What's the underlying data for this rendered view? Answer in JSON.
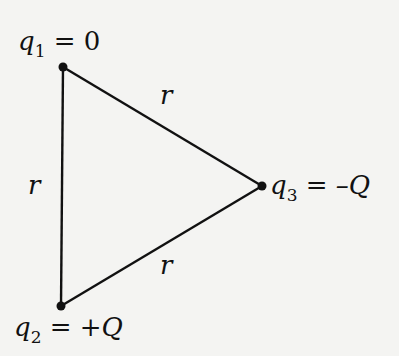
{
  "diagram": {
    "title": "",
    "colors": {
      "background": "#f4f4f2",
      "ink": "#111111"
    },
    "charges": [
      {
        "id": "q1",
        "symbol": "q",
        "subscript": "1",
        "eq": " = ",
        "value": "0",
        "value_italic": false,
        "x": 63,
        "y": 67
      },
      {
        "id": "q2",
        "symbol": "q",
        "subscript": "2",
        "eq": " = ",
        "value": "+Q",
        "value_italic": true,
        "x": 61,
        "y": 306
      },
      {
        "id": "q3",
        "symbol": "q",
        "subscript": "3",
        "eq": " = ",
        "value": "–Q",
        "value_italic": true,
        "x": 262,
        "y": 186
      }
    ],
    "sides": [
      {
        "from": "q1",
        "to": "q2",
        "label": "r"
      },
      {
        "from": "q1",
        "to": "q3",
        "label": "r"
      },
      {
        "from": "q2",
        "to": "q3",
        "label": "r"
      }
    ]
  }
}
